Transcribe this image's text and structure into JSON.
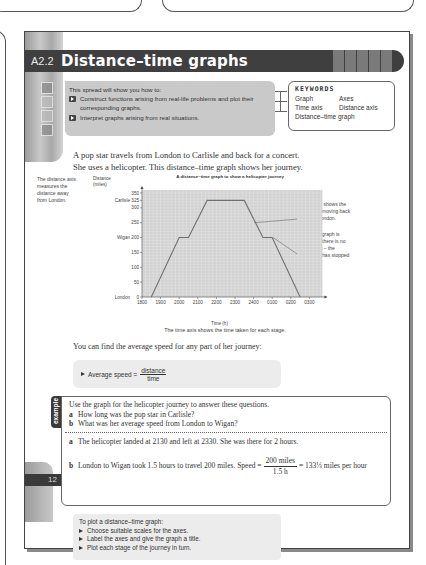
{
  "header": {
    "unit_code": "A2.2",
    "title": "Distance–time graphs"
  },
  "objectives": {
    "intro": "This spread will show you how to:",
    "items": [
      "Construct functions arising from real-life problems and plot their corresponding graphs.",
      "Interpret graphs arising from real situations."
    ]
  },
  "keywords": {
    "title": "KEYWORDS",
    "items": [
      "Graph",
      "Axes",
      "Time axis",
      "Distance axis",
      "Distance–time graph"
    ]
  },
  "intro_text": [
    "A pop star travels from London to Carlisle and back for a concert.",
    "She uses a helicopter. This distance–time graph shows her journey."
  ],
  "notes": {
    "distance_axis": "The distance axis measures the distance away from London.",
    "return_stage": "This stage shows the helicopter moving back towards London.",
    "refuel": "When the graph is horizontal there is no movement – the helicopter has stopped to refuel.",
    "time_axis": "The time axis shows the time taken for each stage."
  },
  "chart_data": {
    "type": "line",
    "title": "A distance–time graph to show a helicopter journey",
    "xlabel": "Time (h)",
    "ylabel": "Distance (miles)",
    "x_ticks": [
      "1800",
      "1900",
      "2000",
      "2100",
      "2200",
      "2300",
      "2400",
      "0100",
      "0200",
      "0300"
    ],
    "y_ticks": [
      0,
      50,
      100,
      150,
      200,
      250,
      300,
      325,
      350
    ],
    "y_place_labels": [
      {
        "value": 0,
        "label": "London"
      },
      {
        "value": 200,
        "label": "Wigan"
      },
      {
        "value": 325,
        "label": "Carlisle"
      }
    ],
    "xlim_hours_after_1800": [
      0,
      9.7
    ],
    "ylim": [
      0,
      360
    ],
    "grid": true,
    "series": [
      {
        "name": "Helicopter journey",
        "points_hours_after_1800": [
          [
            0.5,
            0
          ],
          [
            2.0,
            200
          ],
          [
            2.5,
            200
          ],
          [
            3.5,
            325
          ],
          [
            5.5,
            325
          ],
          [
            6.5,
            200
          ],
          [
            7.0,
            200
          ],
          [
            8.5,
            0
          ]
        ]
      }
    ]
  },
  "average_speed": {
    "intro": "You can find the average speed for any part of her journey:",
    "label": "Average speed =",
    "numerator": "distance",
    "denominator": "time"
  },
  "example": {
    "tab": "example",
    "question_intro": "Use the graph for the helicopter journey to answer these questions.",
    "questions": [
      {
        "label": "a",
        "text": "How long was the pop star in Carlisle?"
      },
      {
        "label": "b",
        "text": "What was her average speed from London to Wigan?"
      }
    ],
    "answers": {
      "a_label": "a",
      "a_text": "The helicopter landed at 2130 and left at 2330. She was there for 2 hours.",
      "b_label": "b",
      "b_text": "London to Wigan took 1.5 hours to travel 200 miles. Speed =",
      "b_num": "200 miles",
      "b_den": "1.5 h",
      "b_result": "= 133⅓ miles per hour"
    }
  },
  "tips": {
    "title": "To plot a distance–time graph:",
    "items": [
      "Choose suitable scales for the axes.",
      "Label the axes and give the graph a title.",
      "Plot each stage of the journey in turn."
    ]
  },
  "page_number": "12"
}
